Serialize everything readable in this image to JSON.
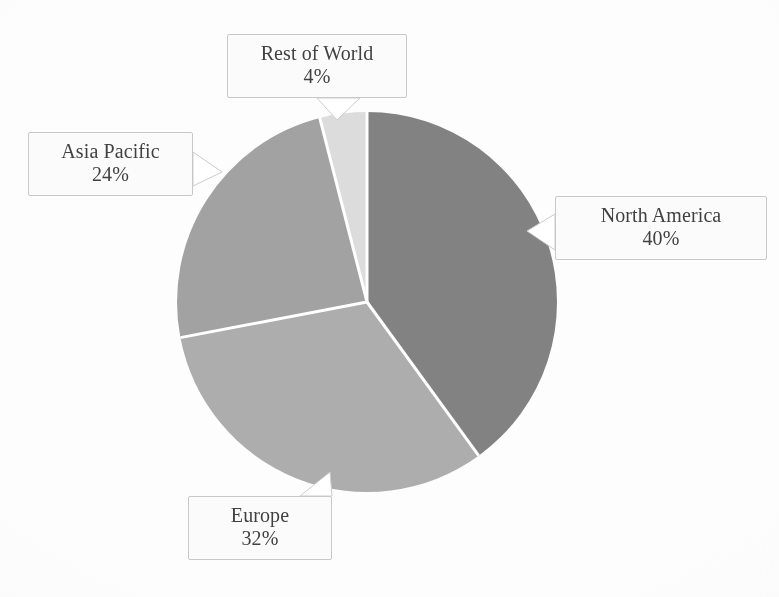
{
  "chart_data": {
    "type": "pie",
    "title": "",
    "subtitle": "",
    "xlabel": "",
    "ylabel": "",
    "legend_position": "none",
    "grid": false,
    "units": "percent",
    "total": 100,
    "categories": [
      "North America",
      "Europe",
      "Asia Pacific",
      "Rest of World"
    ],
    "values": [
      40,
      32,
      24,
      4
    ],
    "value_labels": [
      "40%",
      "32%",
      "24%",
      "4%"
    ],
    "start_angle_deg": 0,
    "direction": "clockwise",
    "slices": [
      {
        "label": "North America",
        "value": 40,
        "value_label": "40%",
        "color": "#828282",
        "start_angle_deg": 0,
        "end_angle_deg": 144
      },
      {
        "label": "Europe",
        "value": 32,
        "value_label": "32%",
        "color": "#adadad",
        "start_angle_deg": 144,
        "end_angle_deg": 259.2
      },
      {
        "label": "Asia Pacific",
        "value": 24,
        "value_label": "24%",
        "color": "#a2a2a2",
        "start_angle_deg": 259.2,
        "end_angle_deg": 345.6
      },
      {
        "label": "Rest of World",
        "value": 4,
        "value_label": "4%",
        "color": "#dcdcdc",
        "start_angle_deg": 345.6,
        "end_angle_deg": 360
      }
    ]
  },
  "geometry": {
    "center_x": 367,
    "center_y": 302,
    "radius": 190,
    "separator_color": "#ffffff",
    "separator_width": 3
  },
  "callouts": {
    "rest_of_world": {
      "name": "Rest of World",
      "value": "4%"
    },
    "asia_pacific": {
      "name": "Asia Pacific",
      "value": "24%"
    },
    "north_america": {
      "name": "North America",
      "value": "40%"
    },
    "europe": {
      "name": "Europe",
      "value": "32%"
    }
  },
  "style": {
    "background": "#fdfdfd",
    "label_text_color": "#3b3b3b",
    "callout_border_color": "#c9c9c9"
  }
}
